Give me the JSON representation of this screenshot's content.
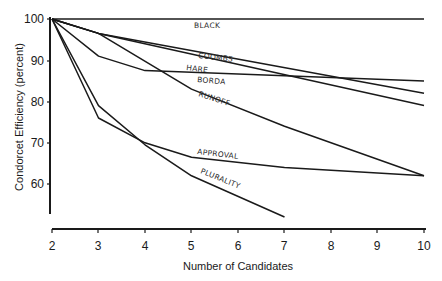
{
  "chart_data": {
    "type": "line",
    "title": "",
    "xlabel": "Number of Candidates",
    "ylabel": "Condorcet Efficiency (percent)",
    "x": [
      2,
      3,
      4,
      5,
      6,
      7,
      8,
      9,
      10
    ],
    "xlim": [
      2,
      10
    ],
    "ylim": [
      52,
      100
    ],
    "x_ticks": [
      "2",
      "3",
      "4",
      "5",
      "6",
      "7",
      "8",
      "9",
      "10"
    ],
    "y_ticks": [
      "60",
      "70",
      "80",
      "90",
      "100"
    ],
    "grid": false,
    "legend": "inline labels",
    "series": [
      {
        "name": "Black",
        "label": "BLACK",
        "x": [
          2,
          10
        ],
        "values": [
          100,
          100
        ]
      },
      {
        "name": "Coombs",
        "label": "COOMBS",
        "x": [
          2,
          3,
          10
        ],
        "values": [
          100,
          96.5,
          82
        ]
      },
      {
        "name": "Hare",
        "label": "HARE",
        "x": [
          2,
          3,
          10
        ],
        "values": [
          100,
          96.5,
          79
        ]
      },
      {
        "name": "Borda",
        "label": "BORDA",
        "x": [
          2,
          3,
          4,
          10
        ],
        "values": [
          100,
          91,
          87.5,
          85
        ]
      },
      {
        "name": "Runoff",
        "label": "RUNOFF",
        "x": [
          2,
          3,
          5,
          7,
          10
        ],
        "values": [
          100,
          96.5,
          83,
          74,
          62
        ]
      },
      {
        "name": "Approval",
        "label": "APPROVAL",
        "x": [
          2,
          3,
          4,
          5,
          7,
          10
        ],
        "values": [
          100,
          76,
          70,
          66.5,
          64,
          62
        ]
      },
      {
        "name": "Plurality",
        "label": "PLURALITY",
        "x": [
          2,
          3,
          4,
          5,
          7
        ],
        "values": [
          100,
          79,
          69.5,
          62,
          52
        ]
      }
    ]
  },
  "labels": {
    "black": "Black",
    "coombs": "Coombs",
    "hare": "Hare",
    "borda": "Borda",
    "runoff": "Runoff",
    "approval": "Approval",
    "plurality": "Plurality",
    "xlabel": "Number of Candidates",
    "ylabel": "Condorcet Efficiency (percent)"
  }
}
